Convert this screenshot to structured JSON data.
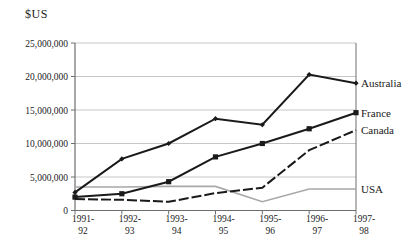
{
  "chart_data": {
    "type": "line",
    "title": "$US",
    "xlabel": "",
    "ylabel": "$US",
    "categories": [
      "1991-92",
      "1992-93",
      "1993-94",
      "1994-95",
      "1995-96",
      "1996-97",
      "1997-98"
    ],
    "series": [
      {
        "name": "USA",
        "values": [
          3500000,
          3500000,
          3600000,
          3600000,
          1300000,
          3200000,
          3200000
        ],
        "color": "#a8a8a8",
        "dash": "none",
        "marker": "none"
      },
      {
        "name": "Canada",
        "values": [
          1700000,
          1600000,
          1300000,
          2600000,
          3400000,
          9000000,
          12000000
        ],
        "color": "#1a1a1a",
        "dash": "10 3",
        "marker": "none"
      },
      {
        "name": "France",
        "values": [
          2000000,
          2500000,
          4300000,
          8000000,
          10000000,
          12200000,
          14600000
        ],
        "color": "#1a1a1a",
        "dash": "none",
        "marker": "square"
      },
      {
        "name": "Australia",
        "values": [
          2700000,
          7700000,
          10000000,
          13700000,
          12800000,
          20300000,
          19000000
        ],
        "color": "#1a1a1a",
        "dash": "none",
        "marker": "diamond"
      }
    ],
    "ylim": [
      0,
      25000000
    ],
    "ytick_step": 5000000,
    "ytick_labels": [
      "0",
      "5,000,000",
      "10,000,000",
      "15,000,000",
      "20,000,000",
      "25,000,000"
    ],
    "grid": "horizontal",
    "legend_position": "right-edge-annotations",
    "colors": {
      "line_black": "#1a1a1a",
      "line_gray": "#a8a8a8",
      "gridline": "#c6c6c6",
      "axis_frame": "#6e6e6e"
    }
  }
}
